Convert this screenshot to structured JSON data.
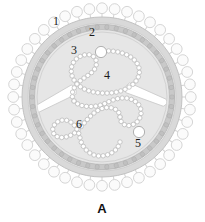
{
  "figure": {
    "panel_letter": "A",
    "background_color": "#ffffff"
  },
  "callouts": [
    {
      "id": "1",
      "label": "1",
      "target": "surface-spike-glycoprotein",
      "x": 56,
      "y": 25
    },
    {
      "id": "2",
      "label": "2",
      "target": "outer-envelope-layer",
      "x": 92,
      "y": 36
    },
    {
      "id": "3",
      "label": "3",
      "target": "matrix-ring-layer",
      "x": 74,
      "y": 54
    },
    {
      "id": "4",
      "label": "4",
      "target": "nucleocapsid-upper-loop",
      "x": 107,
      "y": 79
    },
    {
      "id": "5",
      "label": "5",
      "target": "polymerase-globule-lower",
      "x": 138,
      "y": 147
    },
    {
      "id": "6",
      "label": "6",
      "target": "nucleocapsid-lower-loop",
      "x": 79,
      "y": 128
    }
  ],
  "structures": {
    "spikes": {
      "name": "surface-spike-glycoprotein",
      "count": 44,
      "fill": "#fbfbfb",
      "stroke": "#d5d5d5",
      "head_radius": 5.4,
      "stalk_length": 3.4
    },
    "envelope_outer": {
      "name": "outer-envelope-layer",
      "fill": "#d9d9d9",
      "stroke": "#c2c2c2",
      "radius": 80
    },
    "envelope_inner": {
      "name": "inner-envelope-layer",
      "fill": "#ededed",
      "stroke": "#cfcfcf",
      "radius": 74
    },
    "matrix_ring": {
      "name": "matrix-ring-layer",
      "fill": "#c9c9c9",
      "stroke": "#b4b4b4",
      "segment_count": 46,
      "radius": 70
    },
    "core": {
      "name": "viral-core-lumen",
      "fill": "#e6e6e6",
      "stroke": "#d2d2d2",
      "radius": 65
    },
    "nucleocapsid": {
      "name": "beaded-nucleocapsid-strand",
      "bead_fill": "#ffffff",
      "bead_stroke": "#b8b8b8",
      "bead_radius": 2.2
    },
    "globules": [
      {
        "name": "polymerase-globule-upper",
        "cx": 101,
        "cy": 52,
        "r": 5.6,
        "fill": "#ffffff",
        "stroke": "#a8a8a8"
      },
      {
        "name": "polymerase-globule-lower",
        "cx": 139,
        "cy": 132,
        "r": 5.6,
        "fill": "#ffffff",
        "stroke": "#a8a8a8"
      }
    ],
    "matrix_rods": [
      {
        "name": "matrix-rod-left",
        "cx": 56,
        "cy": 99,
        "angle": -28,
        "fill": "#ffffff",
        "stroke": "#cacaca"
      },
      {
        "name": "matrix-rod-right",
        "cx": 148,
        "cy": 96,
        "angle": 22,
        "fill": "#ffffff",
        "stroke": "#cacaca"
      }
    ]
  }
}
